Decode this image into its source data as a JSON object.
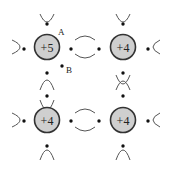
{
  "diagram": {
    "title": "",
    "atoms": [
      {
        "id": "atom-top-left",
        "label": "+5",
        "cx": 47,
        "cy": 47
      },
      {
        "id": "atom-top-right",
        "label": "+4",
        "cx": 123,
        "cy": 47
      },
      {
        "id": "atom-bottom-left",
        "label": "+4",
        "cx": 47,
        "cy": 120
      },
      {
        "id": "atom-bottom-right",
        "label": "+4",
        "cx": 123,
        "cy": 120
      }
    ],
    "annotations": {
      "a": "A",
      "b": "B"
    },
    "colors": {
      "atom_fill": "#cfcfcf",
      "atom_stroke": "#333333",
      "bond": "#555555",
      "electron": "#111111"
    }
  }
}
